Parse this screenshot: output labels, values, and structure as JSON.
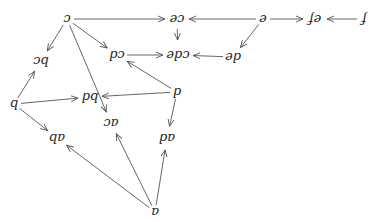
{
  "diagram": {
    "orientation": "rotated 180 degrees",
    "stroke_color": "#555555",
    "text_color": "#222222",
    "nodes": [
      {
        "id": "c",
        "label": "c",
        "x": 67,
        "y": 19
      },
      {
        "id": "ce",
        "label": "ce",
        "x": 177,
        "y": 19
      },
      {
        "id": "e",
        "label": "e",
        "x": 263,
        "y": 19
      },
      {
        "id": "ef",
        "label": "ef",
        "x": 315,
        "y": 19
      },
      {
        "id": "f",
        "label": "f",
        "x": 364,
        "y": 19
      },
      {
        "id": "bc",
        "label": "bc",
        "x": 41,
        "y": 61
      },
      {
        "id": "cd",
        "label": "cd",
        "x": 117,
        "y": 55
      },
      {
        "id": "cde",
        "label": "cde",
        "x": 178,
        "y": 55
      },
      {
        "id": "de",
        "label": "de",
        "x": 233,
        "y": 57
      },
      {
        "id": "b",
        "label": "b",
        "x": 14,
        "y": 104
      },
      {
        "id": "bd",
        "label": "bd",
        "x": 90,
        "y": 97
      },
      {
        "id": "d",
        "label": "d",
        "x": 177,
        "y": 92
      },
      {
        "id": "ac",
        "label": "ac",
        "x": 111,
        "y": 123
      },
      {
        "id": "ab",
        "label": "ab",
        "x": 57,
        "y": 138
      },
      {
        "id": "ad",
        "label": "ad",
        "x": 167,
        "y": 138
      },
      {
        "id": "a",
        "label": "a",
        "x": 155,
        "y": 212
      }
    ],
    "edges": [
      {
        "from": "c",
        "to": "ce"
      },
      {
        "from": "e",
        "to": "ce"
      },
      {
        "from": "e",
        "to": "ef"
      },
      {
        "from": "f",
        "to": "ef"
      },
      {
        "from": "ce",
        "to": "cde"
      },
      {
        "from": "e",
        "to": "de"
      },
      {
        "from": "de",
        "to": "cde"
      },
      {
        "from": "cd",
        "to": "cde"
      },
      {
        "from": "c",
        "to": "bc"
      },
      {
        "from": "c",
        "to": "cd"
      },
      {
        "from": "c",
        "to": "ac"
      },
      {
        "from": "d",
        "to": "cd"
      },
      {
        "from": "d",
        "to": "bd"
      },
      {
        "from": "d",
        "to": "ad"
      },
      {
        "from": "b",
        "to": "bc"
      },
      {
        "from": "b",
        "to": "bd"
      },
      {
        "from": "b",
        "to": "ab"
      },
      {
        "from": "a",
        "to": "ab"
      },
      {
        "from": "a",
        "to": "ac"
      },
      {
        "from": "a",
        "to": "ad"
      }
    ]
  }
}
